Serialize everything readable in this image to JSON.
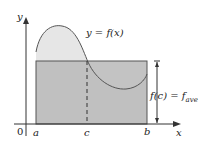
{
  "diagram": {
    "labels": {
      "y_axis": "y",
      "x_axis": "x",
      "origin": "0",
      "a": "a",
      "b": "b",
      "c": "c",
      "curve": "y = f(x)",
      "height": "f(c) = f",
      "height_sub": "ave"
    },
    "colors": {
      "curve_fill": "#e6e6e6",
      "rect_fill": "#b8b8b8",
      "rect_stroke": "#555555",
      "axis": "#333333"
    }
  }
}
